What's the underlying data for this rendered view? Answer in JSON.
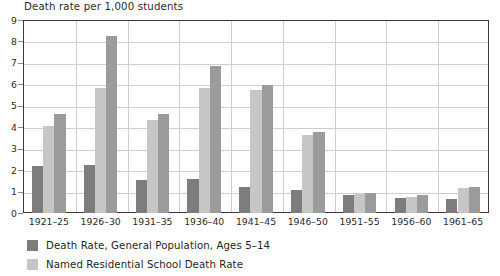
{
  "chart_data": {
    "type": "bar",
    "title": "Death rate per 1,000 students",
    "xlabel": "",
    "ylabel": "Death rate per 1,000 students",
    "ylim": [
      0,
      9
    ],
    "yticks": [
      "0",
      "1",
      "2",
      "3",
      "4",
      "5",
      "6",
      "7",
      "8",
      "9"
    ],
    "grid": true,
    "legend_position": "bottom-left",
    "categories": [
      "1921–25",
      "1926–30",
      "1931–35",
      "1936–40",
      "1941–45",
      "1946–50",
      "1951–55",
      "1956–60",
      "1961–65"
    ],
    "series": [
      {
        "name": "Death Rate, General Population, Ages 5–14",
        "color": "#7d7d7d",
        "values": [
          2.2,
          2.25,
          1.55,
          1.6,
          1.2,
          1.05,
          0.85,
          0.7,
          0.65
        ]
      },
      {
        "name": "Named Residential School Death Rate",
        "color": "#c6c6c6",
        "values": [
          4.05,
          5.85,
          4.35,
          5.85,
          5.75,
          3.65,
          0.9,
          0.75,
          1.15
        ]
      },
      {
        "name": "",
        "color": "#9b9b9b",
        "values": [
          4.6,
          8.25,
          4.6,
          6.85,
          5.95,
          3.8,
          0.95,
          0.85,
          1.2
        ]
      }
    ]
  },
  "axis": {
    "y_ticks": [
      "9",
      "8",
      "7",
      "6",
      "5",
      "4",
      "3",
      "2",
      "1",
      "0"
    ],
    "x_ticks": [
      "1921–25",
      "1926–30",
      "1931–35",
      "1936–40",
      "1941–45",
      "1946–50",
      "1951–55",
      "1956–60",
      "1961–65"
    ]
  },
  "legend": {
    "items": [
      {
        "swatch_color": "#7d7d7d",
        "label": "Death Rate, General Population, Ages 5–14"
      },
      {
        "swatch_color": "#c6c6c6",
        "label": "Named Residential School Death Rate"
      }
    ]
  },
  "colors": {
    "series_dark": "#7d7d7d",
    "series_light": "#c6c6c6",
    "series_medium": "#9b9b9b",
    "frame": "#3a3a3a",
    "gridline": "#cfcfcf",
    "text": "#231f20",
    "background": "#ffffff"
  }
}
